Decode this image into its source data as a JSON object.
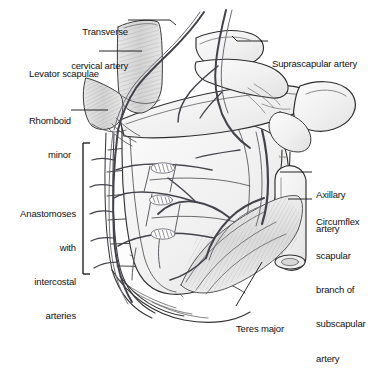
{
  "figure": {
    "background_color": "#ffffff",
    "ink_color": "#1a1a1a",
    "vessel_color": "#4a4a52",
    "bone_fill": "#f2f2f2",
    "muscle_fill": "#dcdcdc",
    "artist_mark": "k.sp"
  },
  "labels": {
    "transverse_cervical_artery": {
      "line1": "Transverse",
      "line2": "cervical artery"
    },
    "levator_scapulae": {
      "line1": "Levator scapulae"
    },
    "rhomboid_minor": {
      "line1": "Rhomboid",
      "line2": "minor"
    },
    "anastomoses": {
      "line1": "Anastomoses",
      "line2": "with",
      "line3": "intercostal",
      "line4": "arteries"
    },
    "suprascapular_artery": {
      "line1": "Suprascapular artery"
    },
    "axillary_artery": {
      "line1": "Axillary",
      "line2": "artery"
    },
    "circumflex_scapular": {
      "line1": "Circumflex",
      "line2": "scapular",
      "line3": "branch of",
      "line4": "subscapular",
      "line5": "artery"
    },
    "teres_major": {
      "line1": "Teres major"
    }
  }
}
